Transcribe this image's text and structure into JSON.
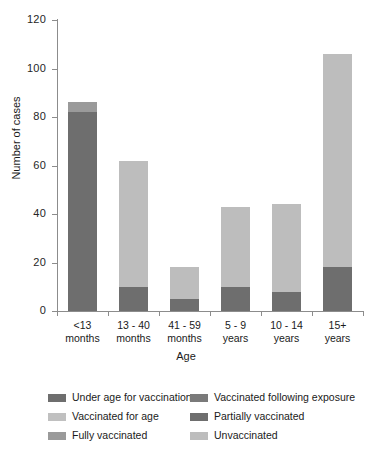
{
  "chart_data": {
    "type": "bar",
    "subtype": "stacked-bar",
    "title": "",
    "xlabel": "Age",
    "ylabel": "Number of cases",
    "ylim": [
      0,
      120
    ],
    "yticks": [
      0,
      20,
      40,
      60,
      80,
      100,
      120
    ],
    "grid": false,
    "legend_position": "bottom",
    "categories": [
      "<13\nmonths",
      "13 - 40\nmonths",
      "41 - 59\nmonths",
      "5 - 9\nyears",
      "10 - 14\nyears",
      "15+\nyears"
    ],
    "series": [
      {
        "name": "Under age for vaccination",
        "color": "#6e6e6e",
        "values": [
          82,
          0,
          0,
          0,
          0,
          0
        ]
      },
      {
        "name": "Vaccinated following exposure",
        "color": "#7a7a7a",
        "values": [
          0,
          0,
          0,
          0,
          0,
          0
        ]
      },
      {
        "name": "Vaccinated for age",
        "color": "#b8b8b8",
        "values": [
          0,
          0,
          0,
          0,
          0,
          0
        ]
      },
      {
        "name": "Partially vaccinated",
        "color": "#6e6e6e",
        "values": [
          0,
          10,
          5,
          10,
          8,
          18
        ]
      },
      {
        "name": "Fully vaccinated",
        "color": "#9a9a9a",
        "values": [
          4,
          0,
          0,
          0,
          0,
          0
        ]
      },
      {
        "name": "Unvaccinated",
        "color": "#bdbdbd",
        "values": [
          0,
          52,
          13,
          33,
          36,
          88
        ]
      }
    ],
    "totals": [
      86,
      62,
      18,
      43,
      44,
      106
    ]
  },
  "axes": {
    "y_title": "Number of cases",
    "x_title": "Age",
    "y_tick_labels": [
      "120",
      "100",
      "80",
      "60",
      "40",
      "20",
      "0"
    ],
    "x_tick_labels": [
      "<13\nmonths",
      "13 - 40\nmonths",
      "41 - 59\nmonths",
      "5 - 9\nyears",
      "10 - 14\nyears",
      "15+\nyears"
    ]
  },
  "legend": {
    "entries": [
      {
        "label": "Under age for vaccination",
        "color": "#6e6e6e"
      },
      {
        "label": "Vaccinated following exposure",
        "color": "#7a7a7a"
      },
      {
        "label": "Vaccinated for age",
        "color": "#c0c0c0"
      },
      {
        "label": "Partially vaccinated",
        "color": "#6e6e6e"
      },
      {
        "label": "Fully vaccinated",
        "color": "#9a9a9a"
      },
      {
        "label": "Unvaccinated",
        "color": "#bdbdbd"
      }
    ]
  },
  "colors": {
    "axis": "#8c8c8c",
    "text": "#1a1a1a",
    "background": "#ffffff"
  }
}
